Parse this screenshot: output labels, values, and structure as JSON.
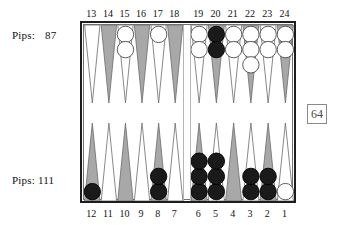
{
  "figure": {
    "name": "backgammon-board-position",
    "colors": {
      "board_border": "#1d1d1d",
      "board_inner_border": "#6f6f6f",
      "board_background": "#ffffff",
      "point_dark": "#a8a8a8",
      "point_light": "#ffffff",
      "point_outline": "#6b6b6b",
      "checker_white_fill": "#ffffff",
      "checker_white_stroke": "#4a4a4a",
      "checker_black_fill": "#1a1a1a",
      "checker_black_stroke": "#000000",
      "text": "#111111",
      "cube_text": "#4a4a4a",
      "cube_border": "#8a8a8a"
    }
  },
  "pips": {
    "top": {
      "label": "Pips:",
      "value": "87"
    },
    "bottom": {
      "label": "Pips:",
      "value": "111"
    }
  },
  "doubling_cube": {
    "value": "64"
  },
  "point_numbers": {
    "top": [
      "13",
      "14",
      "15",
      "16",
      "17",
      "18",
      "19",
      "20",
      "21",
      "22",
      "23",
      "24"
    ],
    "bottom": [
      "12",
      "11",
      "10",
      "9",
      "8",
      "7",
      "6",
      "5",
      "4",
      "3",
      "2",
      "1"
    ]
  },
  "chart_data": {
    "type": "table",
    "xlabel": "",
    "ylabel": "",
    "legend": [
      "white checkers",
      "black checkers"
    ],
    "points": [
      {
        "number": "24",
        "row": "top",
        "slot": 11,
        "triangle": "dark",
        "checkers": 2,
        "color": "white"
      },
      {
        "number": "23",
        "row": "top",
        "slot": 10,
        "triangle": "light",
        "checkers": 2,
        "color": "white"
      },
      {
        "number": "22",
        "row": "top",
        "slot": 9,
        "triangle": "dark",
        "checkers": 3,
        "color": "white"
      },
      {
        "number": "21",
        "row": "top",
        "slot": 8,
        "triangle": "light",
        "checkers": 2,
        "color": "white"
      },
      {
        "number": "20",
        "row": "top",
        "slot": 7,
        "triangle": "dark",
        "checkers": 2,
        "color": "black"
      },
      {
        "number": "19",
        "row": "top",
        "slot": 6,
        "triangle": "light",
        "checkers": 2,
        "color": "white"
      },
      {
        "number": "18",
        "row": "top",
        "slot": 5,
        "triangle": "dark",
        "checkers": 0,
        "color": "none"
      },
      {
        "number": "17",
        "row": "top",
        "slot": 4,
        "triangle": "light",
        "checkers": 1,
        "color": "white"
      },
      {
        "number": "16",
        "row": "top",
        "slot": 3,
        "triangle": "dark",
        "checkers": 0,
        "color": "none"
      },
      {
        "number": "15",
        "row": "top",
        "slot": 2,
        "triangle": "light",
        "checkers": 2,
        "color": "white"
      },
      {
        "number": "14",
        "row": "top",
        "slot": 1,
        "triangle": "dark",
        "checkers": 0,
        "color": "none"
      },
      {
        "number": "13",
        "row": "top",
        "slot": 0,
        "triangle": "light",
        "checkers": 0,
        "color": "none"
      },
      {
        "number": "12",
        "row": "bottom",
        "slot": 0,
        "triangle": "dark",
        "checkers": 1,
        "color": "black"
      },
      {
        "number": "11",
        "row": "bottom",
        "slot": 1,
        "triangle": "light",
        "checkers": 0,
        "color": "none"
      },
      {
        "number": "10",
        "row": "bottom",
        "slot": 2,
        "triangle": "dark",
        "checkers": 0,
        "color": "none"
      },
      {
        "number": "9",
        "row": "bottom",
        "slot": 3,
        "triangle": "light",
        "checkers": 0,
        "color": "none"
      },
      {
        "number": "8",
        "row": "bottom",
        "slot": 4,
        "triangle": "dark",
        "checkers": 2,
        "color": "black"
      },
      {
        "number": "7",
        "row": "bottom",
        "slot": 5,
        "triangle": "light",
        "checkers": 0,
        "color": "none"
      },
      {
        "number": "6",
        "row": "bottom",
        "slot": 6,
        "triangle": "dark",
        "checkers": 3,
        "color": "black"
      },
      {
        "number": "5",
        "row": "bottom",
        "slot": 7,
        "triangle": "light",
        "checkers": 3,
        "color": "black"
      },
      {
        "number": "4",
        "row": "bottom",
        "slot": 8,
        "triangle": "dark",
        "checkers": 0,
        "color": "none"
      },
      {
        "number": "3",
        "row": "bottom",
        "slot": 9,
        "triangle": "light",
        "checkers": 2,
        "color": "black"
      },
      {
        "number": "2",
        "row": "bottom",
        "slot": 10,
        "triangle": "dark",
        "checkers": 2,
        "color": "black"
      },
      {
        "number": "1",
        "row": "bottom",
        "slot": 11,
        "triangle": "light",
        "checkers": 1,
        "color": "white"
      }
    ]
  }
}
